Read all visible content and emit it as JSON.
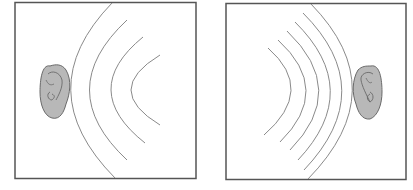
{
  "figure": {
    "panels": [
      {
        "id": "left",
        "description": "Ear on left receiving sound waves spreading from right (wide spacing)",
        "wave_count": 4
      },
      {
        "id": "right",
        "description": "Ear on right receiving sound waves spreading from left (narrow spacing)",
        "wave_count": 6
      }
    ],
    "colors": {
      "frame": "#555555",
      "wave": "#8a8a8a",
      "ear_fill": "#b8b8b8",
      "ear_outline": "#6a6a6a",
      "background": "#ffffff"
    }
  }
}
